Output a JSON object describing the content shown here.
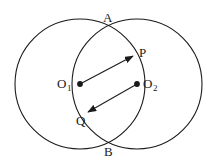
{
  "figure": {
    "background_color": "#ffffff",
    "stroke_color": "#1a1a1a",
    "width": 217,
    "height": 166
  },
  "labels": {
    "a": "A",
    "p": "P",
    "o1_base": "O",
    "o1_sub": "1",
    "o2_base": "O",
    "o2_sub": "2",
    "q": "Q",
    "b": "B"
  },
  "geometry": {
    "circles": [
      {
        "name": "left-circle",
        "cx": 80,
        "cy": 84,
        "r": 65
      },
      {
        "name": "right-circle",
        "cx": 137,
        "cy": 84,
        "r": 65
      }
    ],
    "points": [
      {
        "name": "A",
        "x": 109,
        "y": 26,
        "marker": "none"
      },
      {
        "name": "B",
        "x": 109,
        "y": 142,
        "marker": "none"
      },
      {
        "name": "O1",
        "x": 80,
        "y": 84,
        "marker": "filled-dot"
      },
      {
        "name": "O2",
        "x": 137,
        "y": 84,
        "marker": "filled-dot"
      },
      {
        "name": "P",
        "x": 133,
        "y": 56,
        "marker": "none"
      },
      {
        "name": "Q",
        "x": 88,
        "y": 112,
        "marker": "none"
      }
    ],
    "arrows": [
      {
        "name": "O1-to-P",
        "from": "O1",
        "to": "P",
        "x1": 80,
        "y1": 84,
        "x2": 133,
        "y2": 56
      },
      {
        "name": "O2-to-Q",
        "from": "O2",
        "to": "Q",
        "x1": 137,
        "y1": 84,
        "x2": 88,
        "y2": 112
      }
    ]
  }
}
